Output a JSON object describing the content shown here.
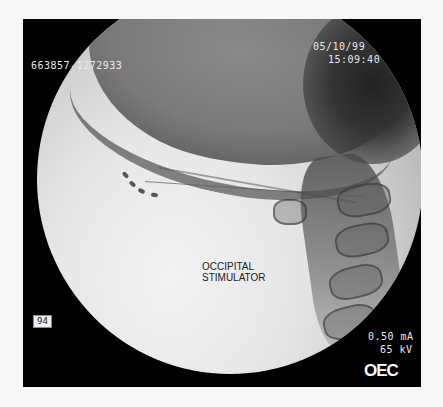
{
  "image": {
    "type": "fluoroscopy-xray",
    "view": "lateral cervical / occipital"
  },
  "overlay": {
    "patient_id": "663857-1272933",
    "date": "05/10/99",
    "time": "15:09:40",
    "frame_number": "94",
    "current": "0.50 mA",
    "voltage": "65 kV",
    "manufacturer_logo": "OEC"
  },
  "annotation": {
    "line1": "OCCIPITAL",
    "line2": "STIMULATOR"
  },
  "colors": {
    "frame_background": "#000000",
    "page_background": "#f7f7f7",
    "overlay_text": "#e8e8e8",
    "annotation_text": "#222222"
  }
}
